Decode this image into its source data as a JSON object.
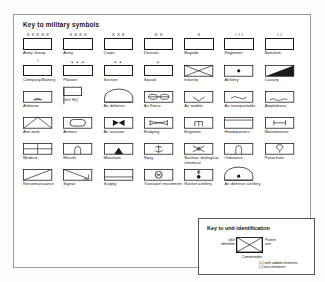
{
  "title": "Key to military symbols",
  "colors": {
    "ink": "#1a1a1a",
    "panel_border": "#9a9a9a",
    "background": "#ffffff"
  },
  "rows": [
    [
      {
        "label": "Army Group",
        "echelon": "X X X X X",
        "glyph": "plain"
      },
      {
        "label": "Army",
        "echelon": "X X X X",
        "glyph": "plain"
      },
      {
        "label": "Corps",
        "echelon": "X X X",
        "glyph": "plain"
      },
      {
        "label": "Division",
        "echelon": "X X",
        "glyph": "plain"
      },
      {
        "label": "Brigade",
        "echelon": "X",
        "glyph": "plain"
      },
      {
        "label": "Regiment",
        "echelon": "I I I",
        "glyph": "plain"
      },
      {
        "label": "Battalion",
        "echelon": "I I",
        "glyph": "plain"
      }
    ],
    [
      {
        "label": "Company/Battery",
        "echelon": "I",
        "glyph": "plain"
      },
      {
        "label": "Platoon",
        "echelon": "• • •",
        "glyph": "plain"
      },
      {
        "label": "Section",
        "echelon": "• •",
        "glyph": "plain"
      },
      {
        "label": "Squad",
        "echelon": "•",
        "glyph": "plain"
      },
      {
        "label": "Infantry",
        "echelon": "",
        "glyph": "infantry"
      },
      {
        "label": "Artillery",
        "echelon": "",
        "glyph": "artillery"
      },
      {
        "label": "Cavalry",
        "echelon": "",
        "glyph": "cavalry"
      }
    ],
    [
      {
        "label": "Airborne",
        "echelon": "",
        "glyph": "airborne"
      },
      {
        "label": "Unit HQ",
        "echelon": "",
        "glyph": "unit-hq"
      },
      {
        "label": "Air defence",
        "echelon": "",
        "glyph": "air-defence"
      },
      {
        "label": "Air Force",
        "echelon": "",
        "glyph": "air-force"
      },
      {
        "label": "Air mobile",
        "echelon": "",
        "glyph": "air-mobile"
      },
      {
        "label": "Air transportable",
        "echelon": "",
        "glyph": "air-transportable"
      },
      {
        "label": "Amphibious",
        "echelon": "",
        "glyph": "amphibious"
      }
    ],
    [
      {
        "label": "Anti-tank",
        "echelon": "",
        "glyph": "anti-tank"
      },
      {
        "label": "Armour",
        "echelon": "",
        "glyph": "armour"
      },
      {
        "label": "Air aviation",
        "echelon": "",
        "glyph": "air-aviation"
      },
      {
        "label": "Bridging",
        "echelon": "",
        "glyph": "bridging"
      },
      {
        "label": "Engineer",
        "echelon": "",
        "glyph": "engineer"
      },
      {
        "label": "Headquarters",
        "echelon": "",
        "glyph": "headquarters"
      },
      {
        "label": "Maintenance",
        "echelon": "",
        "glyph": "maintenance"
      }
    ],
    [
      {
        "label": "Medical",
        "echelon": "",
        "glyph": "medical"
      },
      {
        "label": "Missile",
        "echelon": "",
        "glyph": "missile"
      },
      {
        "label": "Mountain",
        "echelon": "",
        "glyph": "mountain"
      },
      {
        "label": "Navy",
        "echelon": "",
        "glyph": "navy"
      },
      {
        "label": "Nuclear, biological, chemical",
        "echelon": "",
        "glyph": "nbc"
      },
      {
        "label": "Ordnance",
        "echelon": "",
        "glyph": "ordnance"
      },
      {
        "label": "Parachute",
        "echelon": "",
        "glyph": "parachute"
      }
    ],
    [
      {
        "label": "Reconnaissance",
        "echelon": "",
        "glyph": "reconnaissance"
      },
      {
        "label": "Signal",
        "echelon": "",
        "glyph": "signal"
      },
      {
        "label": "Supply",
        "echelon": "",
        "glyph": "supply"
      },
      {
        "label": "Transport movement",
        "echelon": "",
        "glyph": "transport"
      },
      {
        "label": "Rocket artillery",
        "echelon": "",
        "glyph": "rocket-artillery"
      },
      {
        "label": "Air defence artillery",
        "echelon": "",
        "glyph": "air-defence-artillery"
      },
      {
        "label": "",
        "echelon": "",
        "glyph": "none"
      }
    ]
  ],
  "unit_key": {
    "title": "Key to unit identification",
    "left_label_line1": "Unit",
    "left_label_line2": "identifier",
    "right_label_line1": "Parent",
    "right_label_line2": "unit",
    "bottom_label": "Commander",
    "note_line1": "(+) with added elements",
    "note_line2": "(-) less elements"
  }
}
